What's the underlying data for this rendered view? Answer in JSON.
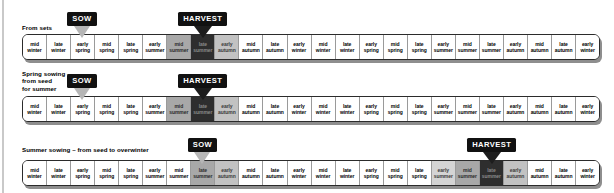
{
  "diagram": {
    "seasons_per_row": 24,
    "season_cells": [
      {
        "q": "mid",
        "s": "winter"
      },
      {
        "q": "late",
        "s": "winter"
      },
      {
        "q": "early",
        "s": "spring"
      },
      {
        "q": "mid",
        "s": "spring"
      },
      {
        "q": "late",
        "s": "spring"
      },
      {
        "q": "early",
        "s": "summer"
      },
      {
        "q": "mid",
        "s": "summer"
      },
      {
        "q": "late",
        "s": "summer"
      },
      {
        "q": "early",
        "s": "autumn"
      },
      {
        "q": "mid",
        "s": "autumn"
      },
      {
        "q": "late",
        "s": "autumn"
      },
      {
        "q": "early",
        "s": "winter"
      },
      {
        "q": "mid",
        "s": "winter"
      },
      {
        "q": "late",
        "s": "winter"
      },
      {
        "q": "early",
        "s": "spring"
      },
      {
        "q": "mid",
        "s": "spring"
      },
      {
        "q": "late",
        "s": "spring"
      },
      {
        "q": "early",
        "s": "summer"
      },
      {
        "q": "mid",
        "s": "summer"
      },
      {
        "q": "late",
        "s": "summer"
      },
      {
        "q": "early",
        "s": "autumn"
      },
      {
        "q": "mid",
        "s": "autumn"
      },
      {
        "q": "late",
        "s": "autumn"
      },
      {
        "q": "early",
        "s": "winter"
      }
    ],
    "rows": [
      {
        "id": "from-sets",
        "label": "From sets",
        "markers": [
          {
            "type": "sow",
            "label": "SOW",
            "style": "light",
            "cell_index": 2
          },
          {
            "type": "harvest",
            "label": "HARVEST",
            "style": "dark",
            "cell_index": 7
          }
        ],
        "shading": [
          {
            "cell_index": 6,
            "level": "sh2"
          },
          {
            "cell_index": 7,
            "level": "sh3"
          },
          {
            "cell_index": 8,
            "level": "sh4"
          }
        ]
      },
      {
        "id": "spring-sowing",
        "label": "Spring sowing –\nfrom seed\nfor summer",
        "markers": [
          {
            "type": "sow",
            "label": "SOW",
            "style": "light",
            "cell_index": 2
          },
          {
            "type": "harvest",
            "label": "HARVEST",
            "style": "dark",
            "cell_index": 7
          }
        ],
        "shading": [
          {
            "cell_index": 6,
            "level": "sh2"
          },
          {
            "cell_index": 7,
            "level": "sh3"
          },
          {
            "cell_index": 8,
            "level": "sh4"
          }
        ]
      },
      {
        "id": "summer-sowing",
        "label": "Summer sowing – from seed to overwinter",
        "markers": [
          {
            "type": "sow",
            "label": "SOW",
            "style": "light",
            "cell_index": 7
          },
          {
            "type": "harvest",
            "label": "HARVEST",
            "style": "dark",
            "cell_index": 19
          }
        ],
        "shading": [
          {
            "cell_index": 7,
            "level": "sh2"
          },
          {
            "cell_index": 8,
            "level": "sh4"
          },
          {
            "cell_index": 17,
            "level": "sh1"
          },
          {
            "cell_index": 18,
            "level": "sh2"
          },
          {
            "cell_index": 19,
            "level": "sh3"
          },
          {
            "cell_index": 20,
            "level": "sh4"
          }
        ]
      }
    ],
    "colors": {
      "bar_border": "#2b2b2b",
      "bar_fill": "#ffffff",
      "badge_bg": "#111111",
      "badge_text": "#ffffff",
      "sow_arrow": "#b6b6b6",
      "harvest_arrow": "#1d1d1d",
      "shadow": "#8e8e8e"
    }
  }
}
